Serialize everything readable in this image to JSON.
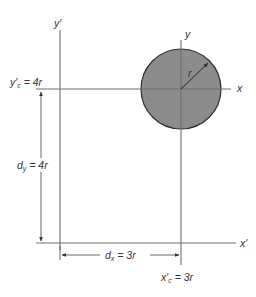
{
  "diagram": {
    "type": "parallel-axis-theorem-circle",
    "colors": {
      "circle_fill": "#8c8c8c",
      "circle_stroke": "#2e2e2e",
      "axis": "#6e6e6e",
      "text": "#333333"
    },
    "axes": {
      "global_y_label": "y′",
      "global_x_label": "x′",
      "centroid_y_label": "y",
      "centroid_x_label": "x"
    },
    "circle": {
      "radius_label": "r"
    },
    "dimensions": {
      "yc_label": "y′",
      "yc_sub": "c",
      "yc_value": " = 4r",
      "xc_label": "x′",
      "xc_sub": "c",
      "xc_value": " = 3r",
      "dy_label": "d",
      "dy_sub": "y",
      "dy_value": " = 4r",
      "dx_label": "d",
      "dx_sub": "x",
      "dx_value": " = 3r"
    }
  }
}
